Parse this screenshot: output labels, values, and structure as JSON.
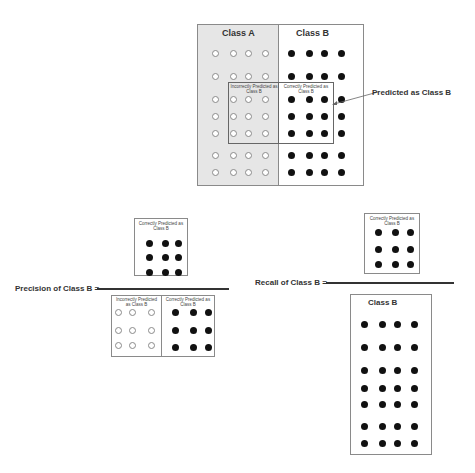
{
  "top_diagram": {
    "class_a_label": "Class A",
    "class_b_label": "Class B",
    "inner_left_label": "Incorrectly Predicted as Class B",
    "inner_right_label": "Correctly Predicted as Class B",
    "callout_label": "Predicted as Class B",
    "class_a_fill": "#e6e6e6",
    "class_b_fill": "#ffffff"
  },
  "precision": {
    "label": "Precision of Class B =",
    "numerator_label": "Correctly Predicted as Class B",
    "denominator_left_label": "Incorrectly Predicted as Class B",
    "denominator_right_label": "Correctly Predicted as Class B"
  },
  "recall": {
    "label": "Recall of Class B =",
    "numerator_label": "Correctly Predicted as Class B",
    "denominator_label": "Class B"
  }
}
